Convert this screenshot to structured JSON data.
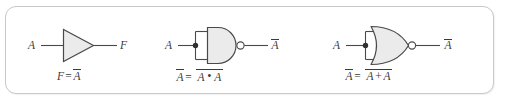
{
  "figure": {
    "background_color": "#ffffff",
    "frame": {
      "border_color": "#c9c9c9",
      "corner_radius": "11px"
    },
    "stroke_color": "#4a4a4a",
    "gate_fill_color": "#ebebeb",
    "text_color": "#3a3a3a"
  },
  "circuits": [
    {
      "id": "inverter",
      "gate_type": "NOT",
      "input_label": "A",
      "output_label": "F",
      "caption": {
        "lhs": "F",
        "equals": "=",
        "rhs_var": "A",
        "rhs_overbar": true,
        "full_text": "F = A̅"
      }
    },
    {
      "id": "nand-tied",
      "gate_type": "NAND",
      "input_label": "A",
      "output_label": "A",
      "output_overbar": true,
      "has_junction_dot": true,
      "has_bubble": true,
      "caption": {
        "lhs_var": "A",
        "lhs_overbar": true,
        "equals": "=",
        "operand_left": "A",
        "operator": "•",
        "operand_right": "A",
        "rhs_overbar": true,
        "full_text": "A̅ = A̅ • A̅"
      }
    },
    {
      "id": "nor-tied",
      "gate_type": "NOR",
      "input_label": "A",
      "output_label": "A",
      "output_overbar": true,
      "has_junction_dot": true,
      "has_bubble": true,
      "caption": {
        "lhs_var": "A",
        "lhs_overbar": true,
        "equals": "=",
        "operand_left": "A",
        "operator": "+",
        "operand_right": "A",
        "rhs_overbar": true,
        "full_text": "A̅ = A̅ + A̅"
      }
    }
  ]
}
